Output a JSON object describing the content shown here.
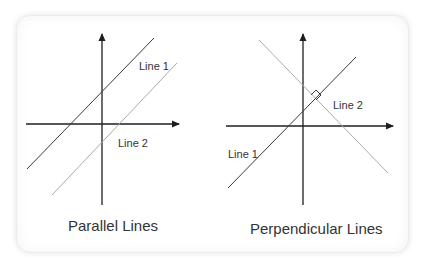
{
  "panels": [
    {
      "title": "Parallel Lines",
      "line1_label": "Line 1",
      "line2_label": "Line 2"
    },
    {
      "title": "Perpendicular Lines",
      "line1_label": "Line 1",
      "line2_label": "Line 2",
      "right_angle_marker": true
    }
  ],
  "colors": {
    "axis": "#1e1e1e",
    "line1": "#3a3a3a",
    "line2": "#aaaaaa",
    "text": "#333333"
  }
}
